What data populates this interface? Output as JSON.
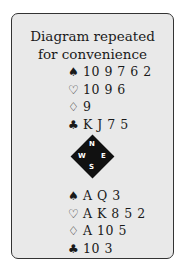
{
  "title_line1": "Diagram repeated",
  "title_line2": "for convenience",
  "north": {
    "spades": "10 9 7 6 2",
    "hearts": "10 9 6",
    "diamonds": "9",
    "clubs": "K J 7 5"
  },
  "south": {
    "spades": "A Q 3",
    "hearts": "A K 8 5 2",
    "diamonds": "A 10 5",
    "clubs": "10 3"
  },
  "suits": {
    "spade": "♠",
    "heart": "♡",
    "diamond": "♢",
    "club": "♣"
  },
  "compass": {
    "n": "N",
    "e": "E",
    "s": "S",
    "w": "W"
  }
}
